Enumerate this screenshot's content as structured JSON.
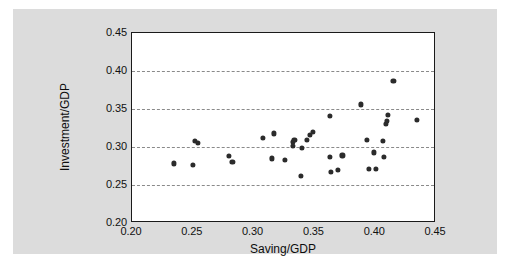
{
  "chart_data": {
    "type": "scatter",
    "title": "",
    "xlabel": "Saving/GDP",
    "ylabel": "Investment/GDP",
    "xlim": [
      0.2,
      0.45
    ],
    "ylim": [
      0.2,
      0.45
    ],
    "xticks": [
      "0.20",
      "0.25",
      "0.30",
      "0.35",
      "0.40",
      "0.45"
    ],
    "xtick_values": [
      0.2,
      0.25,
      0.3,
      0.35,
      0.4,
      0.45
    ],
    "yticks": [
      "0.20",
      "0.25",
      "0.30",
      "0.35",
      "0.40",
      "0.45"
    ],
    "ytick_values": [
      0.2,
      0.25,
      0.3,
      0.35,
      0.4,
      0.45
    ],
    "grid": "horizontal-dashed",
    "gridline_values": [
      0.25,
      0.3,
      0.35,
      0.4
    ],
    "legend": "none",
    "marker": "filled-circle",
    "marker_color": "#2b2b2b",
    "points": [
      {
        "x": 0.2345,
        "y": 0.2785
      },
      {
        "x": 0.25,
        "y": 0.2765
      },
      {
        "x": 0.2515,
        "y": 0.308
      },
      {
        "x": 0.2545,
        "y": 0.305
      },
      {
        "x": 0.2795,
        "y": 0.288
      },
      {
        "x": 0.2825,
        "y": 0.2805
      },
      {
        "x": 0.3075,
        "y": 0.312
      },
      {
        "x": 0.315,
        "y": 0.285
      },
      {
        "x": 0.3165,
        "y": 0.318
      },
      {
        "x": 0.326,
        "y": 0.2835
      },
      {
        "x": 0.332,
        "y": 0.3065
      },
      {
        "x": 0.3325,
        "y": 0.3015
      },
      {
        "x": 0.3335,
        "y": 0.3095
      },
      {
        "x": 0.339,
        "y": 0.2625
      },
      {
        "x": 0.34,
        "y": 0.2985
      },
      {
        "x": 0.3435,
        "y": 0.3095
      },
      {
        "x": 0.346,
        "y": 0.3155
      },
      {
        "x": 0.349,
        "y": 0.3195
      },
      {
        "x": 0.3625,
        "y": 0.341
      },
      {
        "x": 0.363,
        "y": 0.287
      },
      {
        "x": 0.3635,
        "y": 0.267
      },
      {
        "x": 0.369,
        "y": 0.27
      },
      {
        "x": 0.373,
        "y": 0.289
      },
      {
        "x": 0.388,
        "y": 0.356
      },
      {
        "x": 0.3935,
        "y": 0.3095
      },
      {
        "x": 0.3945,
        "y": 0.271
      },
      {
        "x": 0.399,
        "y": 0.293
      },
      {
        "x": 0.4005,
        "y": 0.271
      },
      {
        "x": 0.4065,
        "y": 0.308
      },
      {
        "x": 0.407,
        "y": 0.2865
      },
      {
        "x": 0.409,
        "y": 0.33
      },
      {
        "x": 0.4095,
        "y": 0.334
      },
      {
        "x": 0.4105,
        "y": 0.342
      },
      {
        "x": 0.415,
        "y": 0.3865
      },
      {
        "x": 0.434,
        "y": 0.3355
      }
    ]
  }
}
